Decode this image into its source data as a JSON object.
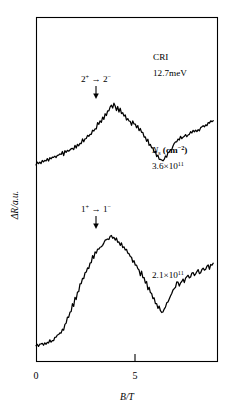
{
  "chart_data": {
    "type": "line",
    "title": "",
    "xlabel": "B/T",
    "ylabel": "ΔR/a.u.",
    "xlim": [
      0,
      7.2
    ],
    "ylim": [
      0,
      1
    ],
    "grid": false,
    "legend_position": "none",
    "xticks": [
      0,
      5
    ],
    "xticklabels": [
      "0",
      "5"
    ],
    "annotations": {
      "sample": "CRI",
      "energy": "12.7meV",
      "density_header_main": "N",
      "density_header_sub": "s",
      "density_header_units_main": "(cm",
      "density_header_units_sup": "−2",
      "density_header_units_close": ")",
      "upper_density_mantissa": "3.6×10",
      "upper_density_exponent": "11",
      "lower_density_mantissa": "2.1×10",
      "lower_density_exponent": "11",
      "upper_transition_from": "2",
      "upper_transition_from_sup": "+",
      "upper_transition_arrow": "→",
      "upper_transition_to": "2",
      "upper_transition_to_sup": "−",
      "lower_transition_from": "1",
      "lower_transition_from_sup": "+",
      "lower_transition_arrow": "→",
      "lower_transition_to": "1",
      "lower_transition_to_sup": "−"
    },
    "series": [
      {
        "name": "3.6×10^11 cm^-2",
        "peak_B": 3.0,
        "minimum_B": 5.0,
        "points": [
          [
            0.0,
            0.3
          ],
          [
            0.05,
            0.312
          ],
          [
            0.1,
            0.298
          ],
          [
            0.15,
            0.318
          ],
          [
            0.2,
            0.305
          ],
          [
            0.25,
            0.326
          ],
          [
            0.3,
            0.313
          ],
          [
            0.35,
            0.334
          ],
          [
            0.4,
            0.322
          ],
          [
            0.45,
            0.344
          ],
          [
            0.5,
            0.33
          ],
          [
            0.55,
            0.352
          ],
          [
            0.6,
            0.34
          ],
          [
            0.65,
            0.362
          ],
          [
            0.7,
            0.35
          ],
          [
            0.75,
            0.372
          ],
          [
            0.8,
            0.358
          ],
          [
            0.85,
            0.38
          ],
          [
            0.9,
            0.368
          ],
          [
            0.95,
            0.39
          ],
          [
            1.0,
            0.378
          ],
          [
            1.05,
            0.402
          ],
          [
            1.1,
            0.388
          ],
          [
            1.15,
            0.412
          ],
          [
            1.2,
            0.4
          ],
          [
            1.25,
            0.424
          ],
          [
            1.3,
            0.41
          ],
          [
            1.35,
            0.436
          ],
          [
            1.4,
            0.424
          ],
          [
            1.45,
            0.45
          ],
          [
            1.5,
            0.438
          ],
          [
            1.55,
            0.464
          ],
          [
            1.6,
            0.452
          ],
          [
            1.65,
            0.48
          ],
          [
            1.7,
            0.468
          ],
          [
            1.75,
            0.496
          ],
          [
            1.8,
            0.484
          ],
          [
            1.85,
            0.514
          ],
          [
            1.9,
            0.502
          ],
          [
            1.95,
            0.534
          ],
          [
            2.0,
            0.522
          ],
          [
            2.05,
            0.556
          ],
          [
            2.1,
            0.546
          ],
          [
            2.15,
            0.58
          ],
          [
            2.2,
            0.57
          ],
          [
            2.25,
            0.606
          ],
          [
            2.3,
            0.596
          ],
          [
            2.35,
            0.634
          ],
          [
            2.4,
            0.626
          ],
          [
            2.45,
            0.664
          ],
          [
            2.5,
            0.656
          ],
          [
            2.55,
            0.694
          ],
          [
            2.6,
            0.688
          ],
          [
            2.65,
            0.726
          ],
          [
            2.7,
            0.72
          ],
          [
            2.75,
            0.758
          ],
          [
            2.8,
            0.754
          ],
          [
            2.85,
            0.79
          ],
          [
            2.9,
            0.788
          ],
          [
            2.95,
            0.82
          ],
          [
            3.0,
            0.84
          ],
          [
            3.05,
            0.822
          ],
          [
            3.1,
            0.846
          ],
          [
            3.15,
            0.82
          ],
          [
            3.2,
            0.8
          ],
          [
            3.25,
            0.82
          ],
          [
            3.3,
            0.782
          ],
          [
            3.35,
            0.8
          ],
          [
            3.4,
            0.76
          ],
          [
            3.45,
            0.776
          ],
          [
            3.5,
            0.736
          ],
          [
            3.55,
            0.75
          ],
          [
            3.6,
            0.71
          ],
          [
            3.65,
            0.722
          ],
          [
            3.7,
            0.684
          ],
          [
            3.75,
            0.7
          ],
          [
            3.8,
            0.666
          ],
          [
            3.85,
            0.69
          ],
          [
            3.9,
            0.66
          ],
          [
            3.95,
            0.676
          ],
          [
            4.0,
            0.64
          ],
          [
            4.05,
            0.652
          ],
          [
            4.1,
            0.612
          ],
          [
            4.15,
            0.622
          ],
          [
            4.2,
            0.58
          ],
          [
            4.25,
            0.59
          ],
          [
            4.3,
            0.546
          ],
          [
            4.35,
            0.556
          ],
          [
            4.4,
            0.51
          ],
          [
            4.45,
            0.52
          ],
          [
            4.5,
            0.472
          ],
          [
            4.55,
            0.482
          ],
          [
            4.6,
            0.436
          ],
          [
            4.65,
            0.444
          ],
          [
            4.7,
            0.4
          ],
          [
            4.75,
            0.408
          ],
          [
            4.8,
            0.368
          ],
          [
            4.85,
            0.376
          ],
          [
            4.9,
            0.342
          ],
          [
            4.95,
            0.35
          ],
          [
            5.0,
            0.326
          ],
          [
            5.05,
            0.34
          ],
          [
            5.1,
            0.34
          ],
          [
            5.15,
            0.362
          ],
          [
            5.2,
            0.368
          ],
          [
            5.25,
            0.392
          ],
          [
            5.3,
            0.4
          ],
          [
            5.35,
            0.426
          ],
          [
            5.4,
            0.436
          ],
          [
            5.45,
            0.462
          ],
          [
            5.5,
            0.472
          ],
          [
            5.55,
            0.498
          ],
          [
            5.6,
            0.506
          ],
          [
            5.65,
            0.53
          ],
          [
            5.7,
            0.52
          ],
          [
            5.75,
            0.542
          ],
          [
            5.8,
            0.528
          ],
          [
            5.85,
            0.55
          ],
          [
            5.9,
            0.54
          ],
          [
            5.95,
            0.562
          ],
          [
            6.0,
            0.552
          ],
          [
            6.05,
            0.574
          ],
          [
            6.1,
            0.564
          ],
          [
            6.15,
            0.588
          ],
          [
            6.2,
            0.576
          ],
          [
            6.25,
            0.6
          ],
          [
            6.3,
            0.588
          ],
          [
            6.35,
            0.612
          ],
          [
            6.4,
            0.602
          ],
          [
            6.45,
            0.626
          ],
          [
            6.5,
            0.616
          ],
          [
            6.55,
            0.64
          ],
          [
            6.6,
            0.63
          ],
          [
            6.65,
            0.654
          ],
          [
            6.7,
            0.646
          ],
          [
            6.75,
            0.67
          ],
          [
            6.8,
            0.66
          ],
          [
            6.85,
            0.684
          ],
          [
            6.9,
            0.676
          ],
          [
            6.95,
            0.7
          ],
          [
            7.0,
            0.696
          ],
          [
            7.05,
            0.712
          ]
        ]
      },
      {
        "name": "2.1×10^11 cm^-2",
        "peak_B": 3.0,
        "minimum_B": 5.0,
        "points": [
          [
            0.0,
            0.052
          ],
          [
            0.05,
            0.062
          ],
          [
            0.1,
            0.05
          ],
          [
            0.15,
            0.064
          ],
          [
            0.2,
            0.052
          ],
          [
            0.25,
            0.066
          ],
          [
            0.3,
            0.054
          ],
          [
            0.35,
            0.068
          ],
          [
            0.4,
            0.058
          ],
          [
            0.45,
            0.074
          ],
          [
            0.5,
            0.064
          ],
          [
            0.55,
            0.08
          ],
          [
            0.6,
            0.072
          ],
          [
            0.65,
            0.09
          ],
          [
            0.7,
            0.084
          ],
          [
            0.75,
            0.104
          ],
          [
            0.8,
            0.098
          ],
          [
            0.85,
            0.122
          ],
          [
            0.9,
            0.118
          ],
          [
            0.95,
            0.146
          ],
          [
            1.0,
            0.142
          ],
          [
            1.05,
            0.176
          ],
          [
            1.1,
            0.174
          ],
          [
            1.15,
            0.212
          ],
          [
            1.2,
            0.212
          ],
          [
            1.25,
            0.254
          ],
          [
            1.3,
            0.256
          ],
          [
            1.35,
            0.3
          ],
          [
            1.4,
            0.304
          ],
          [
            1.45,
            0.35
          ],
          [
            1.5,
            0.356
          ],
          [
            1.55,
            0.402
          ],
          [
            1.6,
            0.408
          ],
          [
            1.65,
            0.452
          ],
          [
            1.7,
            0.458
          ],
          [
            1.75,
            0.502
          ],
          [
            1.8,
            0.506
          ],
          [
            1.85,
            0.548
          ],
          [
            1.9,
            0.552
          ],
          [
            1.95,
            0.592
          ],
          [
            2.0,
            0.596
          ],
          [
            2.05,
            0.632
          ],
          [
            2.1,
            0.636
          ],
          [
            2.15,
            0.67
          ],
          [
            2.2,
            0.672
          ],
          [
            2.25,
            0.704
          ],
          [
            2.3,
            0.706
          ],
          [
            2.35,
            0.734
          ],
          [
            2.4,
            0.738
          ],
          [
            2.45,
            0.762
          ],
          [
            2.5,
            0.764
          ],
          [
            2.55,
            0.786
          ],
          [
            2.6,
            0.79
          ],
          [
            2.65,
            0.808
          ],
          [
            2.7,
            0.812
          ],
          [
            2.75,
            0.826
          ],
          [
            2.8,
            0.83
          ],
          [
            2.85,
            0.84
          ],
          [
            2.9,
            0.846
          ],
          [
            2.95,
            0.85
          ],
          [
            3.0,
            0.856
          ],
          [
            3.05,
            0.846
          ],
          [
            3.1,
            0.852
          ],
          [
            3.15,
            0.834
          ],
          [
            3.2,
            0.84
          ],
          [
            3.25,
            0.818
          ],
          [
            3.3,
            0.824
          ],
          [
            3.35,
            0.798
          ],
          [
            3.4,
            0.804
          ],
          [
            3.45,
            0.776
          ],
          [
            3.5,
            0.782
          ],
          [
            3.55,
            0.752
          ],
          [
            3.6,
            0.758
          ],
          [
            3.65,
            0.726
          ],
          [
            3.7,
            0.734
          ],
          [
            3.75,
            0.7
          ],
          [
            3.8,
            0.708
          ],
          [
            3.85,
            0.672
          ],
          [
            3.9,
            0.68
          ],
          [
            3.95,
            0.644
          ],
          [
            4.0,
            0.652
          ],
          [
            4.05,
            0.614
          ],
          [
            4.1,
            0.622
          ],
          [
            4.15,
            0.582
          ],
          [
            4.2,
            0.59
          ],
          [
            4.25,
            0.548
          ],
          [
            4.3,
            0.556
          ],
          [
            4.35,
            0.512
          ],
          [
            4.4,
            0.52
          ],
          [
            4.45,
            0.474
          ],
          [
            4.5,
            0.482
          ],
          [
            4.55,
            0.436
          ],
          [
            4.6,
            0.444
          ],
          [
            4.65,
            0.398
          ],
          [
            4.7,
            0.406
          ],
          [
            4.75,
            0.36
          ],
          [
            4.8,
            0.368
          ],
          [
            4.85,
            0.326
          ],
          [
            4.9,
            0.334
          ],
          [
            4.95,
            0.3
          ],
          [
            5.0,
            0.308
          ],
          [
            5.05,
            0.3
          ],
          [
            5.1,
            0.32
          ],
          [
            5.15,
            0.33
          ],
          [
            5.2,
            0.356
          ],
          [
            5.25,
            0.368
          ],
          [
            5.3,
            0.396
          ],
          [
            5.35,
            0.41
          ],
          [
            5.4,
            0.438
          ],
          [
            5.45,
            0.452
          ],
          [
            5.5,
            0.478
          ],
          [
            5.55,
            0.49
          ],
          [
            5.6,
            0.512
          ],
          [
            5.65,
            0.52
          ],
          [
            5.7,
            0.5
          ],
          [
            5.75,
            0.514
          ],
          [
            5.8,
            0.536
          ],
          [
            5.85,
            0.548
          ],
          [
            5.9,
            0.526
          ],
          [
            5.95,
            0.54
          ],
          [
            6.0,
            0.562
          ],
          [
            6.05,
            0.572
          ],
          [
            6.1,
            0.548
          ],
          [
            6.15,
            0.56
          ],
          [
            6.2,
            0.584
          ],
          [
            6.25,
            0.594
          ],
          [
            6.3,
            0.57
          ],
          [
            6.35,
            0.582
          ],
          [
            6.4,
            0.604
          ],
          [
            6.45,
            0.614
          ],
          [
            6.5,
            0.59
          ],
          [
            6.55,
            0.602
          ],
          [
            6.6,
            0.622
          ],
          [
            6.65,
            0.632
          ],
          [
            6.7,
            0.61
          ],
          [
            6.75,
            0.622
          ],
          [
            6.8,
            0.64
          ],
          [
            6.85,
            0.648
          ],
          [
            6.9,
            0.63
          ],
          [
            6.95,
            0.642
          ],
          [
            7.0,
            0.652
          ],
          [
            7.05,
            0.66
          ]
        ]
      }
    ]
  }
}
